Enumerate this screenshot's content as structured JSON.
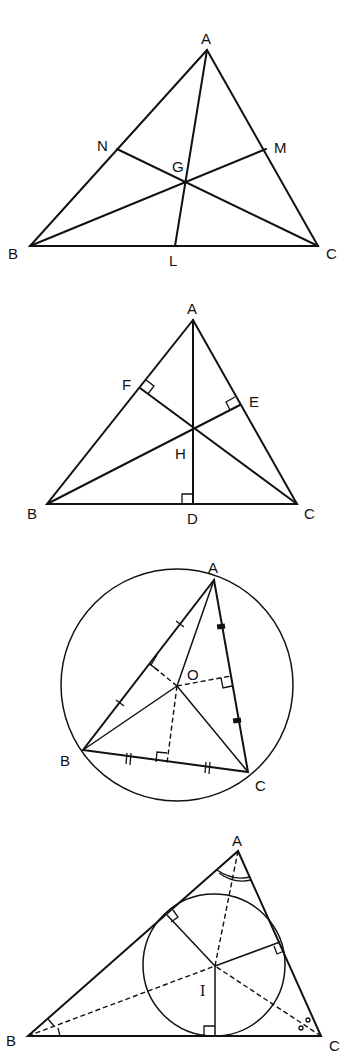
{
  "diagrams": [
    {
      "name": "centroid",
      "title": "Medians meeting at centroid G",
      "labels": {
        "A": "A",
        "B": "B",
        "C": "C",
        "N": "N",
        "M": "M",
        "G": "G",
        "L": "L"
      }
    },
    {
      "name": "orthocenter",
      "title": "Altitudes meeting at orthocenter H",
      "labels": {
        "A": "A",
        "B": "B",
        "C": "C",
        "F": "F",
        "E": "E",
        "H": "H",
        "D": "D"
      }
    },
    {
      "name": "circumcenter",
      "title": "Perpendicular bisectors meeting at circumcenter O",
      "labels": {
        "A": "A",
        "B": "B",
        "C": "C",
        "O": "O"
      }
    },
    {
      "name": "incenter",
      "title": "Angle bisectors meeting at incenter I",
      "labels": {
        "A": "A",
        "B": "B",
        "C": "C",
        "I": "I"
      }
    }
  ],
  "colors": {
    "ink": "#111111",
    "background": "#ffffff"
  }
}
